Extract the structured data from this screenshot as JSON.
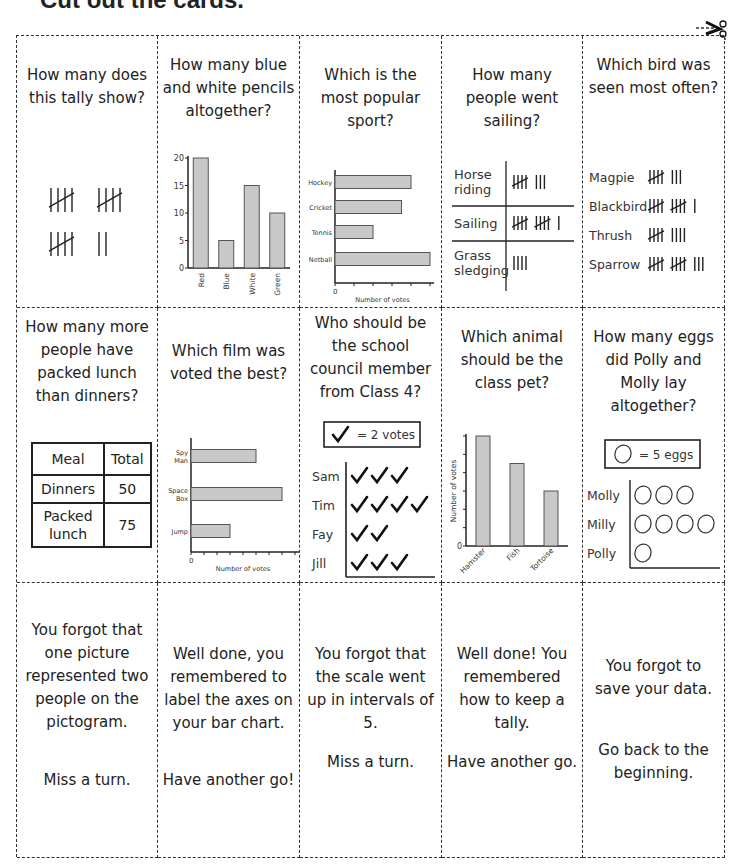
{
  "heading": "Cut out the cards.",
  "icons": {
    "cut_here": "scissors-icon"
  },
  "cards": {
    "tally_count": {
      "question": "How many does this tally show?",
      "tally_groups": [
        5,
        5,
        5,
        2
      ]
    },
    "pencils": {
      "question": "How many blue and white pencils altogether?"
    },
    "sport": {
      "question": "Which is the most popular sport?"
    },
    "sailing": {
      "question": "How many people went sailing?",
      "rows": [
        {
          "label": "Horse riding",
          "tally": 8
        },
        {
          "label": "Sailing",
          "tally": 11
        },
        {
          "label": "Grass sledging",
          "tally": 4
        }
      ]
    },
    "birds": {
      "question": "Which bird was seen most often?",
      "rows": [
        {
          "label": "Magpie",
          "tally": 8
        },
        {
          "label": "Blackbird",
          "tally": 11
        },
        {
          "label": "Thrush",
          "tally": 9
        },
        {
          "label": "Sparrow",
          "tally": 13
        }
      ]
    },
    "lunch": {
      "question": "How many more people have packed lunch than dinners?",
      "table": {
        "headers": [
          "Meal",
          "Total"
        ],
        "rows": [
          [
            "Dinners",
            "50"
          ],
          [
            "Packed lunch",
            "75"
          ]
        ]
      }
    },
    "film": {
      "question": "Which film was voted the best?"
    },
    "council": {
      "question": "Who should be the school council member from Class 4?",
      "key": "= 2 votes",
      "key_icon": "check-icon",
      "rows": [
        {
          "name": "Sam",
          "symbols": 3
        },
        {
          "name": "Tim",
          "symbols": 4
        },
        {
          "name": "Fay",
          "symbols": 2
        },
        {
          "name": "Jill",
          "symbols": 3
        }
      ]
    },
    "animal": {
      "question": "Which animal should be the class pet?"
    },
    "eggs": {
      "question": "How many eggs did Polly and Molly lay altogether?",
      "key": "= 5 eggs",
      "key_icon": "egg-icon",
      "rows": [
        {
          "name": "Molly",
          "symbols": 3
        },
        {
          "name": "Milly",
          "symbols": 4
        },
        {
          "name": "Polly",
          "symbols": 1
        }
      ]
    },
    "feedback": [
      {
        "text": "You forgot that one picture represented two people on the pictogram.",
        "action": "Miss a turn."
      },
      {
        "text": "Well done, you remembered to label the axes on your bar chart.",
        "action": "Have another go!"
      },
      {
        "text": "You forgot that the scale went up in intervals of 5.",
        "action": "Miss a turn."
      },
      {
        "text": "Well done! You remembered how to keep a tally.",
        "action": "Have another go."
      },
      {
        "text": "You forgot to save your data.",
        "action": "Go back to the beginning."
      }
    ]
  },
  "chart_data": [
    {
      "id": "pencils",
      "type": "bar",
      "orientation": "vertical",
      "categories": [
        "Red",
        "Blue",
        "White",
        "Green"
      ],
      "values": [
        20,
        5,
        15,
        10
      ],
      "yticks": [
        "0",
        "5",
        "10",
        "15",
        "20"
      ],
      "ylim": [
        0,
        20
      ],
      "xlabel": "",
      "ylabel": ""
    },
    {
      "id": "sport",
      "type": "bar",
      "orientation": "horizontal",
      "categories": [
        "Hockey",
        "Cricket",
        "Tennis",
        "Netball"
      ],
      "values": [
        4,
        3.5,
        2,
        5
      ],
      "xlim": [
        0,
        5
      ],
      "xtick_label": "0",
      "xlabel": "Number of votes"
    },
    {
      "id": "film",
      "type": "bar",
      "orientation": "horizontal",
      "categories": [
        "Spy Man",
        "Space Box",
        "Jump"
      ],
      "values": [
        5,
        7,
        3
      ],
      "xlim": [
        0,
        8
      ],
      "xtick_label": "0",
      "xlabel": "Number of votes"
    },
    {
      "id": "animal",
      "type": "bar",
      "orientation": "vertical",
      "categories": [
        "Hamster",
        "Fish",
        "Tortoise"
      ],
      "values": [
        6,
        4.5,
        3
      ],
      "ylim": [
        0,
        6
      ],
      "ytick_label": "0",
      "ylabel": "Number of votes"
    }
  ]
}
